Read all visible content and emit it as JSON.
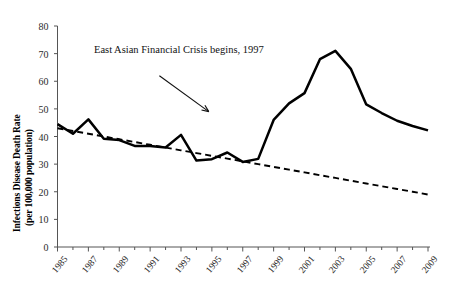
{
  "chart_data": {
    "type": "line",
    "title": "",
    "xlabel": "",
    "ylabel": "Infections Disease Death Rate (per 100,000 population)",
    "ylabel_line1": "Infections Disease Death Rate",
    "ylabel_line2": "(per 100,000 population)",
    "xlim": [
      1985,
      2009
    ],
    "ylim": [
      0,
      80
    ],
    "ytick_values": [
      0,
      10,
      20,
      30,
      40,
      50,
      60,
      70,
      80
    ],
    "ytick_labels": [
      "0",
      "10",
      "20",
      "30",
      "40",
      "50",
      "60",
      "70",
      "80"
    ],
    "xtick_labels": [
      "1985",
      "1987",
      "1989",
      "1991",
      "1993",
      "1995",
      "1997",
      "1999",
      "2001",
      "2003",
      "2005",
      "2007",
      "2009"
    ],
    "xtick_values": [
      1985,
      1987,
      1989,
      1991,
      1993,
      1995,
      1997,
      1999,
      2001,
      2003,
      2005,
      2007,
      2009
    ],
    "minor_ticks_every": 1,
    "grid": false,
    "legend": null,
    "x": [
      1985,
      1986,
      1987,
      1988,
      1989,
      1990,
      1991,
      1992,
      1993,
      1994,
      1995,
      1996,
      1997,
      1998,
      1999,
      2000,
      2001,
      2002,
      2003,
      2004,
      2005,
      2006,
      2007,
      2008,
      2009
    ],
    "series": [
      {
        "name": "Infectious disease death rate",
        "style": "solid",
        "color": "#000000",
        "values": [
          44.5,
          41.0,
          46.2,
          39.2,
          38.7,
          36.6,
          36.6,
          36.0,
          40.6,
          31.3,
          31.8,
          34.2,
          30.8,
          31.9,
          46.0,
          52.0,
          55.7,
          68.0,
          71.0,
          64.5,
          51.6,
          48.5,
          45.7,
          43.8,
          42.2
        ]
      },
      {
        "name": "Trend line",
        "style": "dashed",
        "color": "#000000",
        "values": [
          43.0,
          42.0,
          41.0,
          40.0,
          39.0,
          38.0,
          37.0,
          36.0,
          35.0,
          34.0,
          33.0,
          32.0,
          31.0,
          30.0,
          29.0,
          28.0,
          27.0,
          26.0,
          25.0,
          24.0,
          23.0,
          22.0,
          21.0,
          20.0,
          19.0
        ]
      }
    ],
    "annotations": [
      {
        "text": "East Asian Financial Crisis begins, 1997",
        "arrow_from": [
          1991.6,
          62.0
        ],
        "arrow_to": [
          1994.8,
          49.0
        ]
      }
    ]
  }
}
